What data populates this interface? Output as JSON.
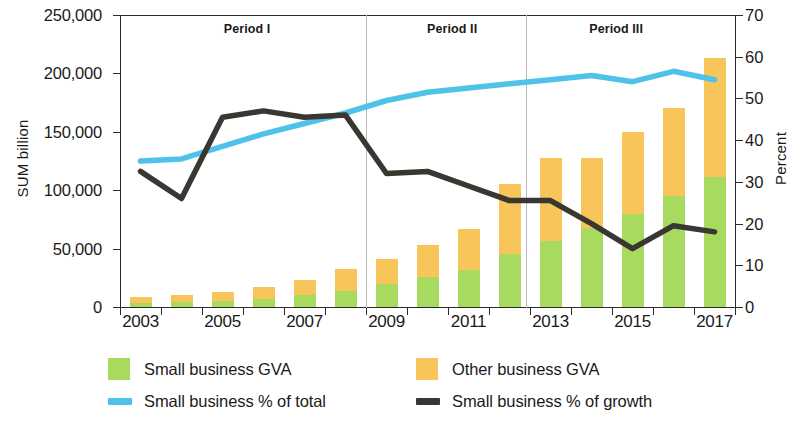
{
  "chart_data": {
    "type": "bar",
    "title": "",
    "subtitle": "",
    "xlabel": "",
    "ylabel": "SUM billion",
    "ylabel_right": "Percent",
    "ylim": [
      0,
      250000
    ],
    "ylim_right": [
      0,
      70
    ],
    "grid": false,
    "legend_position": "bottom",
    "x": [
      2003,
      2004,
      2005,
      2006,
      2007,
      2008,
      2009,
      2010,
      2011,
      2012,
      2013,
      2014,
      2015,
      2016,
      2017
    ],
    "categories": [
      "2003",
      "2004",
      "2005",
      "2006",
      "2007",
      "2008",
      "2009",
      "2010",
      "2011",
      "2012",
      "2013",
      "2014",
      "2015",
      "2016",
      "2017"
    ],
    "xtick_labels": [
      "2003",
      "2005",
      "2007",
      "2009",
      "2011",
      "2013",
      "2015",
      "2017"
    ],
    "ytick_labels_left": [
      "250,000",
      "200,000",
      "150,000",
      "100,000",
      "50,000",
      "0"
    ],
    "ytick_values_left": [
      250000,
      200000,
      150000,
      100000,
      50000,
      0
    ],
    "ytick_labels_right": [
      "70",
      "60",
      "50",
      "40",
      "30",
      "20",
      "10",
      "0"
    ],
    "ytick_values_right": [
      70,
      60,
      50,
      40,
      30,
      20,
      10,
      0
    ],
    "stacked": true,
    "series": [
      {
        "name": "Small business GVA",
        "type": "bar",
        "color": "#a9da60",
        "axis": "left",
        "values": [
          3500,
          4500,
          5500,
          7000,
          10000,
          13500,
          19500,
          25500,
          32000,
          45500,
          56500,
          67500,
          80000,
          95000,
          111000
        ]
      },
      {
        "name": "Other business GVA",
        "type": "bar",
        "color": "#f7c55a",
        "axis": "left",
        "values": [
          5000,
          6000,
          7500,
          10000,
          13500,
          19000,
          22000,
          28000,
          35000,
          60000,
          71500,
          60500,
          70000,
          75000,
          102000
        ]
      },
      {
        "name": "Small business % of total",
        "type": "line",
        "color": "#4ec2e8",
        "axis": "right",
        "values": [
          35.0,
          35.5,
          38.5,
          41.5,
          44.0,
          46.5,
          49.5,
          51.5,
          52.5,
          53.5,
          54.5,
          55.5,
          54.0,
          56.5,
          54.5
        ]
      },
      {
        "name": "Small business % of growth",
        "type": "line",
        "color": "#3a3631",
        "axis": "right",
        "values": [
          32.5,
          26.0,
          45.5,
          47.0,
          45.5,
          46.0,
          32.0,
          32.5,
          29.0,
          25.5,
          25.5,
          20.0,
          14.0,
          19.5,
          18.0
        ]
      }
    ],
    "annotations": [
      {
        "label": "Period I",
        "x_center": 2005.6,
        "span": [
          2002.5,
          2008.5
        ]
      },
      {
        "label": "Period II",
        "x_center": 2010.6,
        "span": [
          2008.5,
          2012.4
        ]
      },
      {
        "label": "Period III",
        "x_center": 2014.6,
        "span": [
          2012.4,
          2017.5
        ]
      }
    ],
    "dividers_x": [
      2008.5,
      2012.4
    ]
  },
  "legend": {
    "items": [
      {
        "label": "Small business GVA",
        "marker": "square-swatch",
        "color": "#a9da60"
      },
      {
        "label": "Other business GVA",
        "marker": "square-swatch",
        "color": "#f7c55a"
      },
      {
        "label": "Small business % of total",
        "marker": "line-swatch",
        "color": "#4ec2e8"
      },
      {
        "label": "Small business % of growth",
        "marker": "line-swatch",
        "color": "#3a3631"
      }
    ]
  },
  "axes": {
    "left_title": "SUM billion",
    "right_title": "Percent"
  }
}
